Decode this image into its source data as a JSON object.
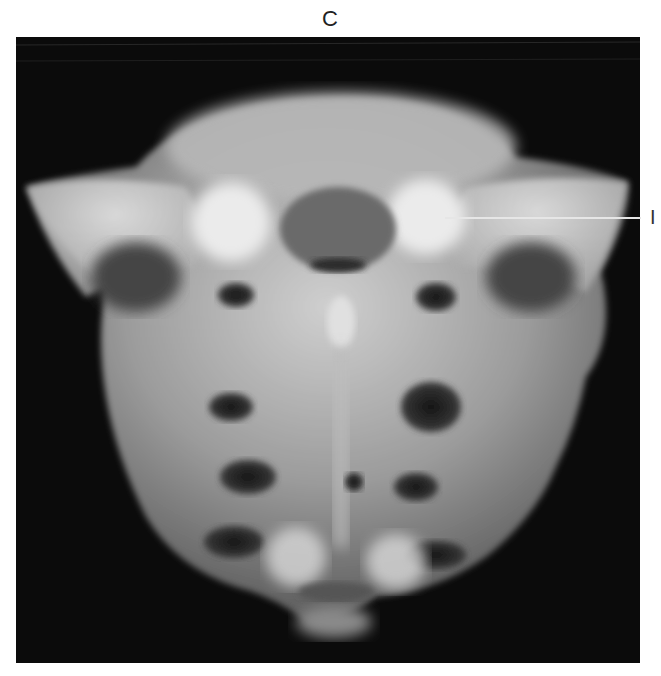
{
  "figure": {
    "panel_label": "C",
    "annotations": [
      {
        "label": "I",
        "target": "sacral ala / superior articular region (right side of image)"
      }
    ]
  },
  "colors": {
    "background": "#ffffff",
    "film": "#0b0b0b",
    "bone_light": "#d8d8d8",
    "bone_mid": "#9a9a9a",
    "foramen": "#1e1e1e",
    "leader_line": "#e6e6e6"
  }
}
